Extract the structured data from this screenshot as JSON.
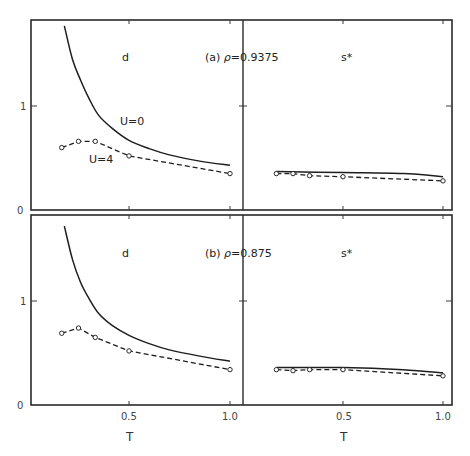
{
  "chart_data": [
    {
      "id": "a",
      "type": "line",
      "title": "(a) ρ=0.9375",
      "panel_title_prefix": "(a) ",
      "rho_label": "ρ",
      "rho_value": "=0.9375",
      "subplots": [
        {
          "name": "d",
          "label": "d",
          "xlabel": "T",
          "xlim": [
            0,
            1.0
          ],
          "ylim": [
            0,
            1.8
          ],
          "xticks": [
            "0.5",
            "1.0"
          ],
          "yticks": [
            "0",
            "1"
          ],
          "series": [
            {
              "name": "U=0",
              "label": "U=0",
              "style": "solid",
              "x": [
                0.18,
                0.22,
                0.26,
                0.3,
                0.35,
                0.42,
                0.5,
                0.6,
                0.7,
                0.85,
                1.0
              ],
              "y": [
                1.77,
                1.45,
                1.25,
                1.08,
                0.91,
                0.78,
                0.67,
                0.59,
                0.53,
                0.47,
                0.43
              ]
            },
            {
              "name": "U=4",
              "label": "U=4",
              "style": "dashed",
              "markers": true,
              "x": [
                0.167,
                0.25,
                0.333,
                0.5,
                1.0
              ],
              "y": [
                0.6,
                0.66,
                0.66,
                0.52,
                0.35
              ]
            }
          ]
        },
        {
          "name": "s*",
          "label": "s*",
          "xlabel": "T",
          "xlim": [
            0,
            1.0
          ],
          "ylim": [
            0,
            1.8
          ],
          "xticks": [
            "0.5",
            "1.0"
          ],
          "yticks": [],
          "series": [
            {
              "name": "U=0",
              "style": "solid",
              "x": [
                0.167,
                0.5,
                0.8,
                1.0
              ],
              "y": [
                0.37,
                0.36,
                0.35,
                0.32
              ]
            },
            {
              "name": "U=4",
              "style": "dashed",
              "markers": true,
              "x": [
                0.167,
                0.25,
                0.333,
                0.5,
                1.0
              ],
              "y": [
                0.35,
                0.35,
                0.33,
                0.32,
                0.28
              ]
            }
          ]
        }
      ]
    },
    {
      "id": "b",
      "type": "line",
      "title": "(b) ρ=0.875",
      "panel_title_prefix": "(b) ",
      "rho_label": "ρ",
      "rho_value": "=0.875",
      "subplots": [
        {
          "name": "d",
          "label": "d",
          "xlabel": "T",
          "xlim": [
            0,
            1.0
          ],
          "ylim": [
            0,
            1.8
          ],
          "xticks": [
            "0.5",
            "1.0"
          ],
          "yticks": [
            "0",
            "1"
          ],
          "series": [
            {
              "name": "U=0",
              "style": "solid",
              "x": [
                0.18,
                0.22,
                0.26,
                0.3,
                0.35,
                0.42,
                0.5,
                0.6,
                0.7,
                0.85,
                1.0
              ],
              "y": [
                1.72,
                1.4,
                1.18,
                1.03,
                0.88,
                0.76,
                0.67,
                0.59,
                0.53,
                0.47,
                0.42
              ]
            },
            {
              "name": "U=4",
              "style": "dashed",
              "markers": true,
              "x": [
                0.167,
                0.25,
                0.333,
                0.5,
                1.0
              ],
              "y": [
                0.69,
                0.74,
                0.65,
                0.52,
                0.34
              ]
            }
          ]
        },
        {
          "name": "s*",
          "label": "s*",
          "xlabel": "T",
          "xlim": [
            0,
            1.0
          ],
          "ylim": [
            0,
            1.8
          ],
          "xticks": [
            "0.5",
            "1.0"
          ],
          "yticks": [],
          "series": [
            {
              "name": "U=0",
              "style": "solid",
              "x": [
                0.167,
                0.5,
                0.8,
                1.0
              ],
              "y": [
                0.36,
                0.36,
                0.34,
                0.31
              ]
            },
            {
              "name": "U=4",
              "style": "dashed",
              "markers": true,
              "x": [
                0.167,
                0.25,
                0.333,
                0.5,
                1.0
              ],
              "y": [
                0.34,
                0.33,
                0.34,
                0.34,
                0.28
              ]
            }
          ]
        }
      ]
    }
  ],
  "annotations": {
    "u0": "U=0",
    "u4": "U=4"
  }
}
